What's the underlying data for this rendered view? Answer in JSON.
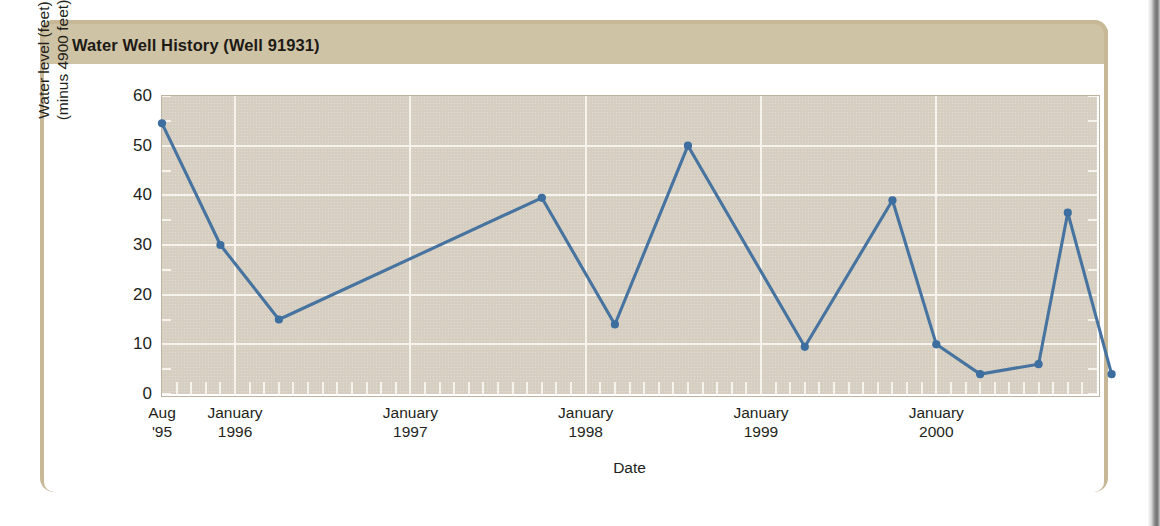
{
  "card": {
    "title": "Water Well History (Well 91931)"
  },
  "chart_data": {
    "type": "line",
    "title": "Water Well History (Well 91931)",
    "xlabel": "Date",
    "ylabel": "Water level (feet) (minus 4900 feet)",
    "ylabel_lines": [
      "Water level (feet)",
      "(minus 4900 feet)"
    ],
    "ylim": [
      0,
      60
    ],
    "ytick_values": [
      0,
      10,
      20,
      30,
      40,
      50,
      60
    ],
    "ytick_labels": [
      "0",
      "10",
      "20",
      "30",
      "40",
      "50",
      "60"
    ],
    "grid": true,
    "grid_axis": "both",
    "legend": "none",
    "xlim_months": [
      0,
      64
    ],
    "x_start": "1995-08",
    "x_minor_tick_interval": "1 month",
    "xtick_labels": [
      {
        "lines": [
          "Aug",
          "'95"
        ],
        "month_index": 0
      },
      {
        "lines": [
          "January",
          "1996"
        ],
        "month_index": 5
      },
      {
        "lines": [
          "January",
          "1997"
        ],
        "month_index": 17
      },
      {
        "lines": [
          "January",
          "1998"
        ],
        "month_index": 29
      },
      {
        "lines": [
          "January",
          "1999"
        ],
        "month_index": 41
      },
      {
        "lines": [
          "January",
          "2000"
        ],
        "month_index": 53
      }
    ],
    "series": [
      {
        "name": "Water level",
        "color": "#46739f",
        "marker": "circle",
        "points": [
          {
            "label": "Aug 1995",
            "month_index": 0,
            "value": 54.5
          },
          {
            "label": "Dec 1995",
            "month_index": 4,
            "value": 30.0
          },
          {
            "label": "Apr 1996",
            "month_index": 8,
            "value": 15.0
          },
          {
            "label": "Oct 1997",
            "month_index": 26,
            "value": 39.5
          },
          {
            "label": "Mar 1998",
            "month_index": 31,
            "value": 14.0
          },
          {
            "label": "Aug 1998",
            "month_index": 36,
            "value": 50.0
          },
          {
            "label": "Apr 1999",
            "month_index": 44,
            "value": 9.5
          },
          {
            "label": "Nov 1999",
            "month_index": 50,
            "value": 39.0
          },
          {
            "label": "Feb 2000",
            "month_index": 53,
            "value": 10.0
          },
          {
            "label": "May 2000",
            "month_index": 56,
            "value": 4.0
          },
          {
            "label": "Sep 2000",
            "month_index": 60,
            "value": 6.0
          },
          {
            "label": "Nov 2000",
            "month_index": 62,
            "value": 36.5
          },
          {
            "label": "Feb 2001",
            "month_index": 65,
            "value": 4.0
          }
        ]
      }
    ],
    "colors": {
      "line": "#46739f",
      "marker": "#3d6ea0",
      "plot_background": "#d6cec0",
      "gridline": "#f6f3ec",
      "card_border": "#c7b897",
      "title_bar": "#cfc3a6",
      "text": "#231f1a"
    }
  }
}
